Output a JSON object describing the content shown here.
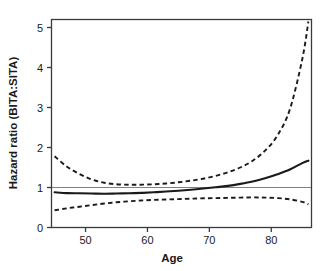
{
  "chart_data": {
    "type": "line",
    "title": "",
    "xlabel": "Age",
    "ylabel": "Hazard ratio (BITA:SITA)",
    "xlim": [
      44.5,
      86.5
    ],
    "ylim": [
      0,
      5.2
    ],
    "xticks": [
      50,
      60,
      70,
      80
    ],
    "xtick_labels": [
      "50",
      "60",
      "70",
      "80"
    ],
    "yticks": [
      0,
      1,
      2,
      3,
      4,
      5
    ],
    "ytick_labels": [
      "0",
      "1",
      "2",
      "3",
      "4",
      "5"
    ],
    "grid": false,
    "legend": "none",
    "reference_line": {
      "name": "null-effect-line",
      "orientation": "horizontal",
      "y": 1,
      "color": "#808080"
    },
    "x": [
      45,
      47,
      49,
      51,
      53,
      55,
      57,
      59,
      61,
      63,
      65,
      67,
      69,
      71,
      73,
      75,
      77,
      79,
      81,
      83,
      85,
      86
    ],
    "series": [
      {
        "name": "upper-confidence-limit",
        "label": "Upper 95% CI",
        "style": "dashed",
        "color": "#1a1a1a",
        "values": [
          1.78,
          1.52,
          1.34,
          1.2,
          1.12,
          1.08,
          1.07,
          1.07,
          1.08,
          1.1,
          1.13,
          1.17,
          1.22,
          1.29,
          1.38,
          1.5,
          1.67,
          1.92,
          2.3,
          2.95,
          4.2,
          5.15
        ]
      },
      {
        "name": "point-estimate",
        "label": "Hazard ratio",
        "style": "solid",
        "color": "#1a1a1a",
        "values": [
          0.88,
          0.86,
          0.855,
          0.85,
          0.845,
          0.85,
          0.855,
          0.865,
          0.88,
          0.9,
          0.92,
          0.945,
          0.975,
          1.005,
          1.04,
          1.09,
          1.15,
          1.23,
          1.33,
          1.45,
          1.61,
          1.67
        ]
      },
      {
        "name": "lower-confidence-limit",
        "label": "Lower 95% CI",
        "style": "dashed",
        "color": "#1a1a1a",
        "values": [
          0.43,
          0.48,
          0.52,
          0.56,
          0.6,
          0.63,
          0.655,
          0.675,
          0.69,
          0.7,
          0.71,
          0.72,
          0.73,
          0.735,
          0.74,
          0.748,
          0.752,
          0.748,
          0.735,
          0.705,
          0.64,
          0.58
        ]
      }
    ]
  },
  "axes": {
    "y_title": "Hazard ratio (BITA:SITA)",
    "x_title": "Age"
  }
}
